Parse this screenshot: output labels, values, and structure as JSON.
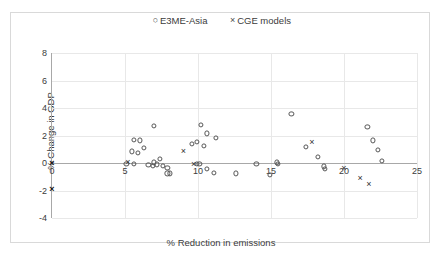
{
  "legend": {
    "position": "top-center",
    "items": [
      {
        "label": "E3ME-Asia",
        "marker": "circle-marker-icon",
        "glyph": "○"
      },
      {
        "label": "CGE models",
        "marker": "cross-marker-icon",
        "glyph": "×"
      }
    ]
  },
  "chart_data": {
    "type": "scatter",
    "title": "",
    "xlabel": "% Reduction in emissions",
    "ylabel": "% Change in GDP",
    "xlim": [
      0,
      25
    ],
    "ylim": [
      -4,
      8
    ],
    "xticks": [
      0,
      5,
      10,
      15,
      20,
      25
    ],
    "yticks": [
      -4,
      -2,
      0,
      2,
      4,
      6,
      8
    ],
    "xtick_labels": [
      "0",
      "5",
      "10",
      "15",
      "20",
      "25"
    ],
    "ytick_labels": [
      "-4",
      "-2",
      "0",
      "2",
      "4",
      "6",
      "8"
    ],
    "grid": true,
    "series": [
      {
        "name": "E3ME-Asia",
        "marker": "circle",
        "points": [
          [
            5.6,
            1.7
          ],
          [
            6.0,
            1.65
          ],
          [
            5.5,
            0.85
          ],
          [
            5.9,
            0.75
          ],
          [
            6.3,
            1.1
          ],
          [
            5.1,
            -0.05
          ],
          [
            5.6,
            -0.05
          ],
          [
            7.0,
            2.7
          ],
          [
            7.0,
            0.05
          ],
          [
            7.4,
            0.3
          ],
          [
            7.6,
            -0.2
          ],
          [
            7.9,
            -0.35
          ],
          [
            7.9,
            -0.75
          ],
          [
            8.1,
            -0.75
          ],
          [
            6.6,
            -0.15
          ],
          [
            6.9,
            -0.2
          ],
          [
            7.2,
            -0.1
          ],
          [
            10.2,
            2.75
          ],
          [
            10.6,
            2.15
          ],
          [
            11.2,
            1.85
          ],
          [
            9.9,
            1.55
          ],
          [
            10.4,
            1.25
          ],
          [
            9.6,
            1.4
          ],
          [
            9.9,
            -0.05
          ],
          [
            10.1,
            -0.05
          ],
          [
            10.6,
            -0.45
          ],
          [
            11.1,
            -0.7
          ],
          [
            12.6,
            -0.75
          ],
          [
            14.0,
            -0.05
          ],
          [
            14.9,
            -0.85
          ],
          [
            15.4,
            0.05
          ],
          [
            15.5,
            -0.05
          ],
          [
            16.4,
            3.6
          ],
          [
            17.4,
            1.2
          ],
          [
            18.2,
            0.45
          ],
          [
            18.6,
            -0.25
          ],
          [
            18.7,
            -0.4
          ],
          [
            21.6,
            2.6
          ],
          [
            22.0,
            1.65
          ],
          [
            22.3,
            0.95
          ],
          [
            22.6,
            0.15
          ]
        ]
      },
      {
        "name": "CGE models",
        "marker": "cross",
        "points": [
          [
            0.0,
            0.0
          ],
          [
            0.0,
            -1.9
          ],
          [
            5.2,
            0.1
          ],
          [
            9.0,
            0.85
          ],
          [
            9.7,
            -0.05
          ],
          [
            17.8,
            1.5
          ],
          [
            20.0,
            -0.35
          ],
          [
            21.1,
            -1.1
          ],
          [
            21.7,
            -1.5
          ]
        ]
      }
    ]
  }
}
